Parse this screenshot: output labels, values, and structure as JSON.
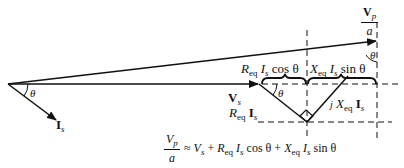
{
  "diagram": {
    "type": "phasor_diagram",
    "angle_symbol": "θ",
    "labels": {
      "vp_over_a": {
        "num_main": "V",
        "num_sub": "p",
        "den": "a"
      },
      "vs": {
        "main": "V",
        "sub": "s"
      },
      "is": {
        "main": "I",
        "sub": "s"
      },
      "req_is_cos": {
        "r": "R",
        "r_sub": "eq",
        "i": "I",
        "i_sub": "s",
        "func": "cos θ"
      },
      "xeq_is_sin": {
        "x": "X",
        "x_sub": "eq",
        "i": "I",
        "i_sub": "s",
        "func": "sin θ"
      },
      "req_is": {
        "r": "R",
        "r_sub": "eq",
        "i": "I",
        "i_sub": "s"
      },
      "jxeq_is": {
        "j": "j",
        "x": "X",
        "x_sub": "eq",
        "i": "I",
        "i_sub": "s"
      },
      "theta_origin": "θ",
      "theta_drop": "θ",
      "theta_tip": "θ"
    },
    "equation": {
      "lhs_num": "V",
      "lhs_num_sub": "p",
      "lhs_den": "a",
      "approx": "≈",
      "t1": "V",
      "t1_sub": "s",
      "plus1": "+",
      "t2_r": "R",
      "t2_r_sub": "eq",
      "t2_i": "I",
      "t2_i_sub": "s",
      "t2_func": "cos θ",
      "plus2": "+",
      "t3_x": "X",
      "t3_x_sub": "eq",
      "t3_i": "I",
      "t3_i_sub": "s",
      "t3_func": "sin θ"
    },
    "colors": {
      "ink": "#111111",
      "background": "#ffffff"
    }
  }
}
